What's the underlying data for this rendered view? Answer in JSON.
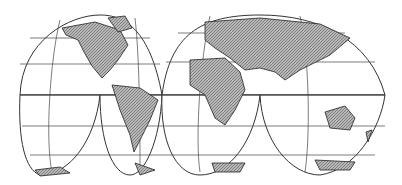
{
  "map": {
    "projection": "interrupted homolosine (Goode)",
    "lobes": [
      "north-america-lobe",
      "eurasia-lobe",
      "south-pacific-lobe",
      "south-america-lobe",
      "africa-lobe",
      "indian-ocean-lobe"
    ],
    "landmasses": [
      "North America",
      "South America",
      "Europe",
      "Asia",
      "Africa",
      "Australia",
      "Antarctica",
      "Greenland",
      "New Zealand"
    ],
    "colors": {
      "land": "#9a9a9a",
      "ocean": "#ffffff",
      "lines": "#333333"
    }
  }
}
